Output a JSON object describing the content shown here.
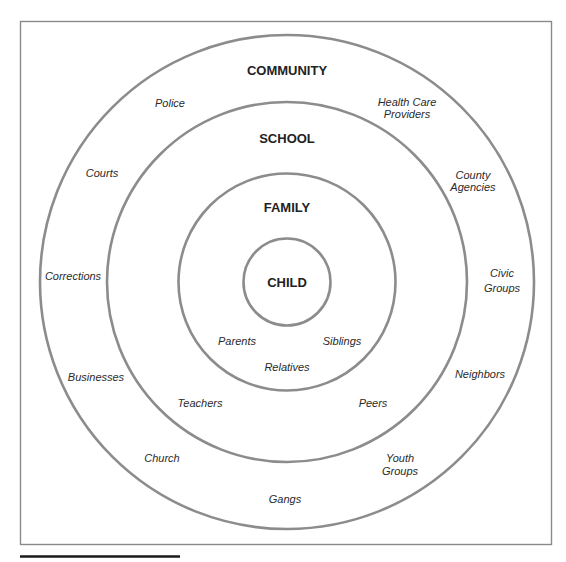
{
  "diagram": {
    "type": "concentric-circles",
    "levels": [
      {
        "name": "CHILD",
        "items": []
      },
      {
        "name": "FAMILY",
        "items": [
          "Parents",
          "Siblings",
          "Relatives"
        ]
      },
      {
        "name": "SCHOOL",
        "items": [
          "Teachers",
          "Peers"
        ]
      },
      {
        "name": "COMMUNITY",
        "items": [
          "Police",
          "Health Care Providers",
          "Courts",
          "County Agencies",
          "Corrections",
          "Civic Groups",
          "Businesses",
          "Neighbors",
          "Church",
          "Youth Groups",
          "Gangs"
        ]
      }
    ],
    "labels": {
      "child": "CHILD",
      "family": "FAMILY",
      "school": "SCHOOL",
      "community": "COMMUNITY",
      "parents": "Parents",
      "siblings": "Siblings",
      "relatives": "Relatives",
      "teachers": "Teachers",
      "peers": "Peers",
      "police": "Police",
      "health_care_1": "Health Care",
      "health_care_2": "Providers",
      "courts": "Courts",
      "county_1": "County",
      "county_2": "Agencies",
      "corrections": "Corrections",
      "civic_1": "Civic",
      "civic_2": "Groups",
      "businesses": "Businesses",
      "neighbors": "Neighbors",
      "church": "Church",
      "youth_1": "Youth",
      "youth_2": "Groups",
      "gangs": "Gangs"
    },
    "colors": {
      "ring_stroke": "#8c8c8c",
      "text": "#222222",
      "rule": "#1a1a1a"
    }
  }
}
